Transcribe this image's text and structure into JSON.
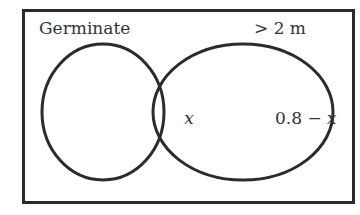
{
  "diagram": {
    "type": "venn",
    "universe_label": "",
    "sets": [
      {
        "name": "Germinate",
        "label": "Germinate"
      },
      {
        "name": "greater-than-2m",
        "label": "> 2 m"
      }
    ],
    "regions": {
      "intersection": "x",
      "right_only": "0.8 − x",
      "left_only": ""
    },
    "colors": {
      "stroke": "#2b2b2b",
      "text": "#333333",
      "background": "#ffffff"
    }
  }
}
